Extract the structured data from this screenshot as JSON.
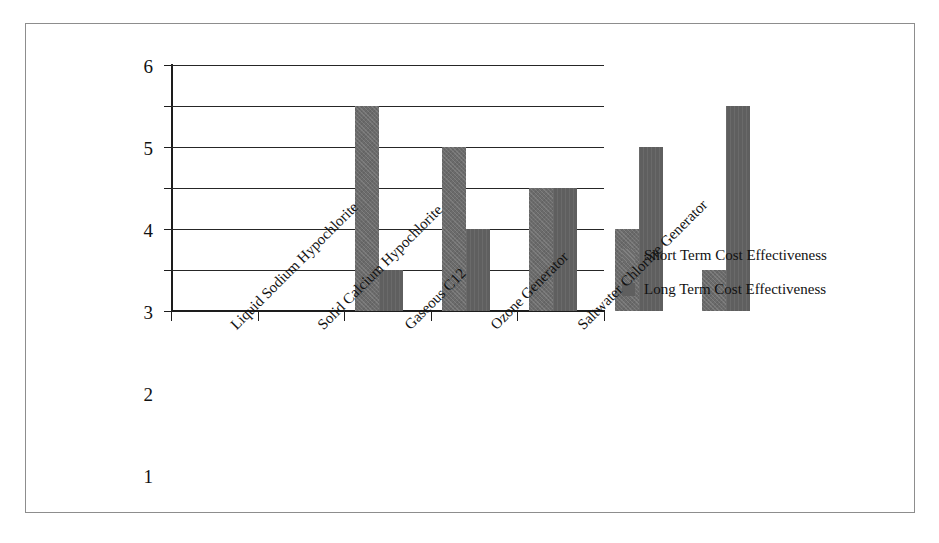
{
  "chart_data": {
    "type": "bar",
    "title": "",
    "xlabel": "",
    "ylabel": "",
    "ylim": [
      0,
      6
    ],
    "yticks": [
      0,
      1,
      2,
      3,
      4,
      5,
      6
    ],
    "ytick_labels": [
      "0",
      "1",
      "2",
      "3",
      "4",
      "5",
      "6"
    ],
    "grid": true,
    "legend_position": "right",
    "categories": [
      "Liquid Sodium Hypochlorite",
      "Solid Calcium Hypochlorite",
      "Gaseous C12",
      "Ozone Generator",
      "Saltwater Chlorine Generator"
    ],
    "series": [
      {
        "name": "Short Term Cost Effectiveness",
        "color": "#6b6b6b",
        "values": [
          5,
          4,
          3,
          2,
          1
        ]
      },
      {
        "name": "Long Term Cost Effectiveness",
        "color": "#5f5f5f",
        "values": [
          1,
          2,
          3,
          4,
          5
        ]
      }
    ]
  },
  "legend": {
    "items": [
      {
        "label": "Short Term Cost Effectiveness"
      },
      {
        "label": "Long Term Cost Effectiveness"
      }
    ]
  },
  "colors": {
    "frame": "#8d8d8d",
    "axis": "#1d1d1d",
    "gridline": "#262626",
    "background": "#ffffff",
    "short_term_bar": "#6b6b6b",
    "long_term_bar": "#5f5f5f"
  }
}
